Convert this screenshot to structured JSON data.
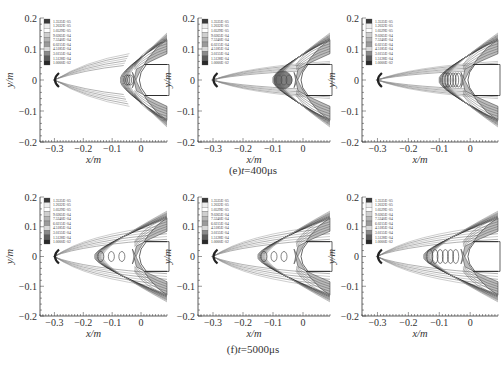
{
  "figure": {
    "rows": [
      {
        "caption": "(e)t=400μs",
        "caption_parts": {
          "prefix": "(e)",
          "var": "t",
          "suffix": "=400μs"
        }
      },
      {
        "caption": "(f)t=5000μs",
        "caption_parts": {
          "prefix": "(f)",
          "var": "t",
          "suffix": "=5000μs"
        }
      }
    ]
  },
  "chart_data": [
    {
      "type": "heatmap",
      "subtype": "contour",
      "row": 0,
      "col": 0,
      "title": "",
      "xlabel": "x/m",
      "ylabel": "y/m",
      "xlim": [
        -0.35,
        0.09
      ],
      "ylim": [
        -0.2,
        0.2
      ],
      "xticks": [
        "-0.3",
        "-0.2",
        "-0.1",
        "0"
      ],
      "yticks": [
        "0.2",
        "0.1",
        "0",
        "-0.1",
        "-0.2"
      ],
      "caption": "(e)t=400μs"
    },
    {
      "type": "heatmap",
      "subtype": "contour",
      "row": 0,
      "col": 1,
      "title": "",
      "xlabel": "x/m",
      "ylabel": "y/m",
      "xlim": [
        -0.35,
        0.09
      ],
      "ylim": [
        -0.2,
        0.2
      ],
      "xticks": [
        "-0.3",
        "-0.2",
        "-0.1",
        "0"
      ],
      "yticks": [
        "0.2",
        "0.1",
        "0",
        "-0.1",
        "-0.2"
      ],
      "caption": "(e)t=400μs"
    },
    {
      "type": "heatmap",
      "subtype": "contour",
      "row": 0,
      "col": 2,
      "title": "",
      "xlabel": "x/m",
      "ylabel": "y/m",
      "xlim": [
        -0.35,
        0.09
      ],
      "ylim": [
        -0.2,
        0.2
      ],
      "xticks": [
        "-0.3",
        "-0.2",
        "-0.1",
        "0"
      ],
      "yticks": [
        "0.2",
        "0.1",
        "0",
        "-0.1",
        "-0.2"
      ],
      "caption": "(e)t=400μs"
    },
    {
      "type": "heatmap",
      "subtype": "contour",
      "row": 1,
      "col": 0,
      "title": "",
      "xlabel": "x/m",
      "ylabel": "y/m",
      "xlim": [
        -0.35,
        0.09
      ],
      "ylim": [
        -0.2,
        0.2
      ],
      "xticks": [
        "-0.3",
        "-0.2",
        "-0.1",
        "0"
      ],
      "yticks": [
        "0.2",
        "0.1",
        "0",
        "-0.1",
        "-0.2"
      ],
      "caption": "(f)t=5000μs"
    },
    {
      "type": "heatmap",
      "subtype": "contour",
      "row": 1,
      "col": 1,
      "title": "",
      "xlabel": "x/m",
      "ylabel": "y/m",
      "xlim": [
        -0.35,
        0.09
      ],
      "ylim": [
        -0.2,
        0.2
      ],
      "xticks": [
        "-0.3",
        "-0.2",
        "-0.1",
        "0"
      ],
      "yticks": [
        "0.2",
        "0.1",
        "0",
        "-0.1",
        "-0.2"
      ],
      "caption": "(f)t=5000μs"
    },
    {
      "type": "heatmap",
      "subtype": "contour",
      "row": 1,
      "col": 2,
      "title": "",
      "xlabel": "x/m",
      "ylabel": "y/m",
      "xlim": [
        -0.35,
        0.09
      ],
      "ylim": [
        -0.2,
        0.2
      ],
      "xticks": [
        "-0.3",
        "-0.2",
        "-0.1",
        "0"
      ],
      "yticks": [
        "0.2",
        "0.1",
        "0",
        "-0.1",
        "-0.2"
      ],
      "caption": "(f)t=5000μs"
    }
  ],
  "legend": {
    "levels": [
      "1.3535E+05",
      "1.2032E+05",
      "1.0529E+05",
      "9.0265E+04",
      "7.5240E+04",
      "6.0215E+04",
      "4.5185E+04",
      "3.0155E+04",
      "1.5128E+04",
      "1.0000E+02"
    ],
    "colors": [
      "#3a3a3a",
      "#ededed",
      "#ffffff",
      "#cfcfcf",
      "#b5b5b5",
      "#9a9a9a",
      "#d8d8d8",
      "#8a8a8a",
      "#5c5c5c",
      "#2a2a2a"
    ]
  },
  "axes": {
    "xlabel": "x/m",
    "ylabel": "y/m",
    "xticks": [
      "-0.3",
      "-0.2",
      "-0.1",
      "0"
    ],
    "yticks": [
      "0.2",
      "0.1",
      "0",
      "-0.1",
      "-0.2"
    ]
  }
}
